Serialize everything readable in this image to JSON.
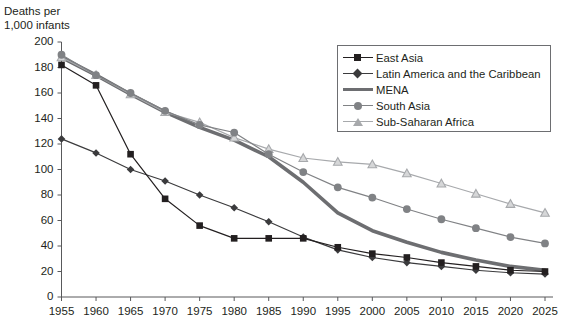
{
  "axis": {
    "y_title_line1": "Deaths per",
    "y_title_line2": "1,000 infants",
    "y_ticks": [
      "200",
      "180",
      "160",
      "140",
      "120",
      "100",
      "80",
      "60",
      "40",
      "20",
      "0"
    ],
    "x_ticks": [
      "1955",
      "1960",
      "1965",
      "1970",
      "1975",
      "1980",
      "1985",
      "1990",
      "1995",
      "2000",
      "2005",
      "2010",
      "2015",
      "2020",
      "2025"
    ]
  },
  "legend": {
    "items": [
      {
        "label": "East Asia",
        "marker": "square-marker",
        "color": "#231f20"
      },
      {
        "label": "Latin America and the Caribbean",
        "marker": "diamond-marker",
        "color": "#3b3b3d"
      },
      {
        "label": "MENA",
        "marker": "thick-line-marker",
        "color": "#6d6e71"
      },
      {
        "label": "South Asia",
        "marker": "circle-marker",
        "color": "#808285"
      },
      {
        "label": "Sub-Saharan Africa",
        "marker": "triangle-marker",
        "color": "#a7a9ac"
      }
    ]
  },
  "chart_data": {
    "type": "line",
    "title": "",
    "xlabel": "",
    "ylabel": "Deaths per 1,000 infants",
    "ylim": [
      0,
      200
    ],
    "ytick_step": 20,
    "grid": false,
    "legend_position": "top-right",
    "x": [
      1955,
      1960,
      1965,
      1970,
      1975,
      1980,
      1985,
      1990,
      1995,
      2000,
      2005,
      2010,
      2015,
      2020,
      2025
    ],
    "series": [
      {
        "name": "East Asia",
        "marker": "square",
        "color": "#231f20",
        "values": [
          182,
          166,
          112,
          77,
          56,
          46,
          46,
          46,
          39,
          34,
          31,
          27,
          24,
          21,
          20
        ]
      },
      {
        "name": "Latin America and the Caribbean",
        "marker": "diamond",
        "color": "#3b3b3d",
        "values": [
          124,
          113,
          100,
          91,
          80,
          70,
          59,
          47,
          37,
          31,
          27,
          24,
          21,
          19,
          18
        ]
      },
      {
        "name": "MENA",
        "marker": "none",
        "color": "#6d6e71",
        "values": [
          188,
          174,
          159,
          145,
          133,
          123,
          110,
          90,
          66,
          52,
          43,
          35,
          29,
          24,
          21
        ]
      },
      {
        "name": "South Asia",
        "marker": "circle",
        "color": "#808285",
        "values": [
          190,
          174,
          160,
          146,
          135,
          129,
          112,
          98,
          86,
          78,
          69,
          61,
          54,
          47,
          42
        ]
      },
      {
        "name": "Sub-Saharan Africa",
        "marker": "triangle",
        "color": "#a7a9ac",
        "values": [
          188,
          174,
          159,
          145,
          137,
          125,
          116,
          109,
          106,
          104,
          97,
          89,
          81,
          73,
          66
        ]
      }
    ]
  }
}
